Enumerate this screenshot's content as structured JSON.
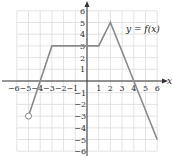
{
  "chart_data": {
    "type": "line",
    "title": "",
    "label": "y = f(x)",
    "xlabel": "x",
    "ylabel": "y",
    "xlim": [
      -6,
      6
    ],
    "ylim": [
      -6,
      6
    ],
    "grid": true,
    "x_ticks": [
      -6,
      -5,
      -4,
      -3,
      -2,
      -1,
      1,
      2,
      3,
      4,
      5,
      6
    ],
    "y_ticks": [
      -6,
      -5,
      -4,
      -3,
      -2,
      -1,
      1,
      2,
      3,
      4,
      5,
      6
    ],
    "points": [
      {
        "x": -5,
        "y": -3,
        "marker": "open"
      },
      {
        "x": -3,
        "y": 3
      },
      {
        "x": 1,
        "y": 3
      },
      {
        "x": 2,
        "y": 5
      },
      {
        "x": 6,
        "y": -5
      }
    ],
    "x_intercepts": [
      -4,
      4
    ],
    "colors": {
      "line": "#8a8a8a",
      "grid": "#dcdcdc",
      "axis": "#333333"
    }
  },
  "labels": {
    "function": "y = f(x)",
    "x_axis": "x",
    "x_ticks": [
      "−6",
      "−5",
      "−4",
      "−3",
      "−2",
      "−1",
      "1",
      "2",
      "3",
      "4",
      "5",
      "6"
    ],
    "y_ticks_pos": [
      "1",
      "2",
      "3",
      "4",
      "5",
      "6"
    ],
    "y_ticks_neg": [
      "−1",
      "−2",
      "−3",
      "−4",
      "−5",
      "−6"
    ]
  }
}
